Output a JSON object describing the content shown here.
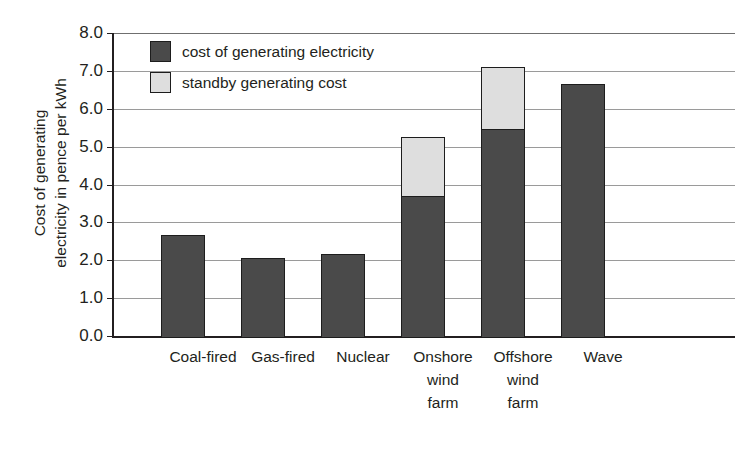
{
  "chart_data": {
    "type": "bar",
    "stacked": true,
    "title": "",
    "xlabel": "",
    "ylabel": "Cost of generating electricity in pence per kWh",
    "ylabel_lines": [
      "Cost of generating",
      "electricity in pence per kWh"
    ],
    "ylim": [
      0.0,
      8.0
    ],
    "ytick_step": 1.0,
    "yticks": [
      "0.0",
      "1.0",
      "2.0",
      "3.0",
      "4.0",
      "5.0",
      "6.0",
      "7.0",
      "8.0"
    ],
    "ytick_values": [
      0.0,
      1.0,
      2.0,
      3.0,
      4.0,
      5.0,
      6.0,
      7.0,
      8.0
    ],
    "grid": true,
    "grid_axis": "y",
    "legend_position": "top-left-inside",
    "categories": [
      "Coal-fired",
      "Gas-fired",
      "Nuclear",
      "Onshore wind farm",
      "Offshore wind farm",
      "Wave"
    ],
    "category_lines": [
      [
        "Coal-fired"
      ],
      [
        "Gas-fired"
      ],
      [
        "Nuclear"
      ],
      [
        "Onshore",
        "wind",
        "farm"
      ],
      [
        "Offshore",
        "wind",
        "farm"
      ],
      [
        "Wave"
      ]
    ],
    "series": [
      {
        "name": "cost of generating electricity",
        "color": "#4a4a4a",
        "values": [
          2.7,
          2.1,
          2.2,
          3.75,
          5.5,
          6.7
        ]
      },
      {
        "name": "standby generating cost",
        "color": "#dedede",
        "values": [
          0,
          0,
          0,
          1.6,
          1.7,
          0
        ]
      }
    ],
    "totals": [
      2.7,
      2.1,
      2.2,
      5.35,
      7.2,
      6.7
    ]
  },
  "legend": {
    "items": [
      {
        "label": "cost of generating electricity",
        "swatch": "dark"
      },
      {
        "label": "standby generating cost",
        "swatch": "light"
      }
    ]
  },
  "colors": {
    "dark_bar": "#4a4a4a",
    "light_bar": "#dedede",
    "axis": "#231f20",
    "gridline": "#9a9a9a",
    "background": "#ffffff"
  }
}
